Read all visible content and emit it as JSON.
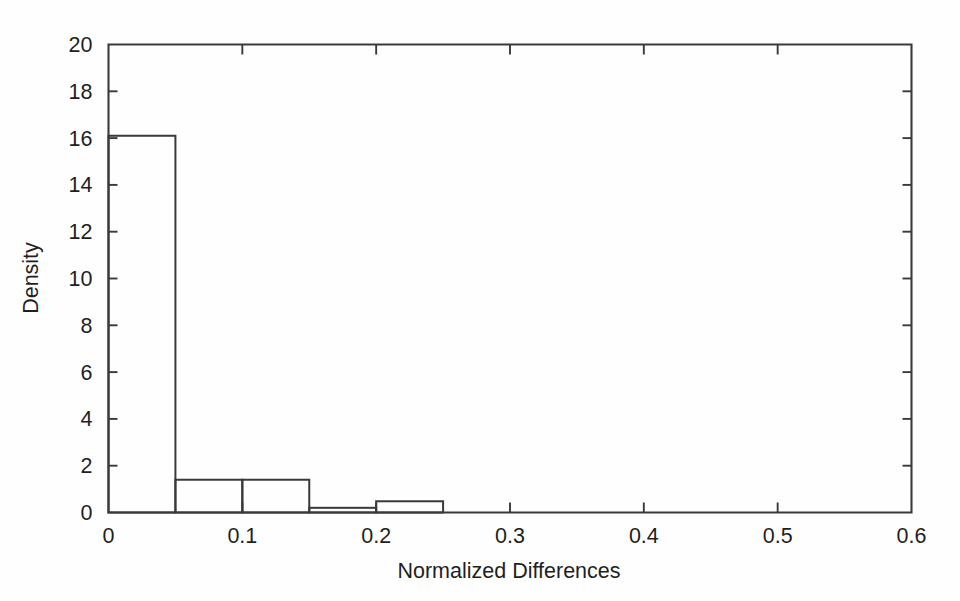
{
  "figure": {
    "background_color": "#fefefe",
    "line_color": "#3a3a3a",
    "text_color": "#1f1f1f"
  },
  "chart_data": {
    "type": "bar",
    "title": "",
    "subtitle": "",
    "xlabel": "Normalized Differences",
    "ylabel": "Density",
    "xlim": [
      0,
      0.6
    ],
    "ylim": [
      0,
      20
    ],
    "grid": false,
    "legend": null,
    "legend_position": "none",
    "bin_width": 0.05,
    "bin_edges": [
      0,
      0.05,
      0.1,
      0.15,
      0.2,
      0.25,
      0.3,
      0.35,
      0.4,
      0.45,
      0.5,
      0.55,
      0.6
    ],
    "categories": [
      "0.00-0.05",
      "0.05-0.10",
      "0.10-0.15",
      "0.15-0.20",
      "0.20-0.25",
      "0.25-0.30",
      "0.30-0.35",
      "0.35-0.40",
      "0.40-0.45",
      "0.45-0.50",
      "0.50-0.55",
      "0.55-0.60"
    ],
    "values": [
      16.1,
      1.4,
      1.4,
      0.2,
      0.48,
      0,
      0,
      0,
      0,
      0,
      0,
      0
    ],
    "x_ticks_major": [
      0,
      0.1,
      0.2,
      0.3,
      0.4,
      0.5,
      0.6
    ],
    "x_tick_labels": [
      "0",
      "0.1",
      "0.2",
      "0.3",
      "0.4",
      "0.5",
      "0.6"
    ],
    "x_ticks_minor": [
      0.05,
      0.15,
      0.25,
      0.35,
      0.45,
      0.55
    ],
    "y_ticks": [
      0,
      2,
      4,
      6,
      8,
      10,
      12,
      14,
      16,
      18,
      20
    ],
    "y_tick_labels": [
      "0",
      "2",
      "4",
      "6",
      "8",
      "10",
      "12",
      "14",
      "16",
      "18",
      "20"
    ],
    "annotations": []
  }
}
